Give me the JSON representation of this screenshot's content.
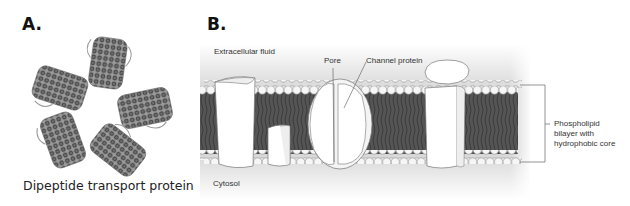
{
  "panel_a": {
    "label": "A.",
    "caption": "Dipeptide transport protein",
    "subunit_count": 5
  },
  "panel_b": {
    "label": "B.",
    "labels": {
      "extracellular": "Extracellular fluid",
      "pore": "Pore",
      "channel_protein": "Channel protein",
      "cytosol": "Cytosol",
      "bilayer": "Phospholipid\nbilayer with\nhydrophobic core"
    }
  },
  "colors": {
    "background": "#ffffff",
    "bilayer_core": "#4a4a4a",
    "head_fill": "#f4f4f4",
    "protein_fill": "#ffffff",
    "outline": "#555555",
    "gradient_dark": "#c8c8c8"
  }
}
